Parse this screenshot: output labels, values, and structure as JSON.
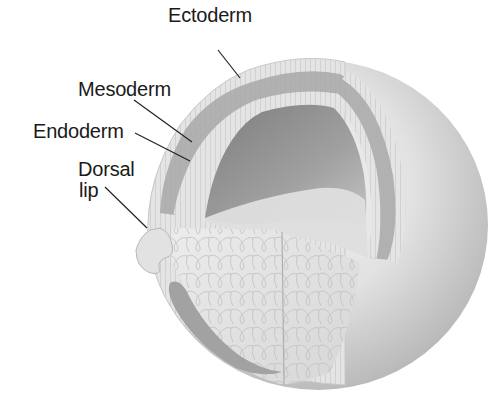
{
  "diagram": {
    "labels": {
      "ectoderm": "Ectoderm",
      "mesoderm": "Mesoderm",
      "endoderm": "Endoderm",
      "dorsal_lip_line1": "Dorsal",
      "dorsal_lip_line2": "lip"
    },
    "colors": {
      "background": "#ffffff",
      "sphere_light": "#ececec",
      "sphere_shadow": "#bdbdbd",
      "cell_layer": "#dcdcdc",
      "mesoderm_band": "#a9a9a9",
      "archenteron": "#8e8e8e",
      "yolk": "#e6e6e6",
      "label_text": "#1a1a1a",
      "leader_line": "#222222"
    }
  }
}
